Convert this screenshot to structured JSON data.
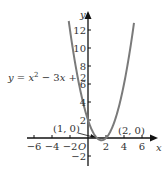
{
  "chart_data": {
    "type": "line",
    "title": "",
    "equation_label": "y = x² − 3x + 2",
    "xlabel": "x",
    "ylabel": "y",
    "origin_label": "O",
    "xlim": [
      -7,
      7
    ],
    "ylim": [
      -3,
      13.5
    ],
    "x_ticks": [
      -6,
      -4,
      -2,
      2,
      4,
      6
    ],
    "y_ticks": [
      -2,
      2,
      4,
      6,
      8,
      10,
      12
    ],
    "grid": false,
    "series": [
      {
        "name": "y = x^2 - 3x + 2",
        "x": [
          -2.14,
          -2,
          -1,
          0,
          1,
          1.5,
          2,
          3,
          4,
          5,
          5.14
        ],
        "values": [
          13,
          12,
          6,
          2,
          0,
          -0.25,
          0,
          2,
          6,
          12,
          13
        ],
        "color": "#7a7a7a"
      }
    ],
    "annotations": [
      {
        "text": "(1, 0)",
        "x": 1,
        "y": 0,
        "side": "left"
      },
      {
        "text": "(2, 0)",
        "x": 2,
        "y": 0,
        "side": "right"
      }
    ]
  },
  "colors": {
    "curve": "#7a7a7a",
    "axis": "#111111",
    "text": "#333333"
  }
}
